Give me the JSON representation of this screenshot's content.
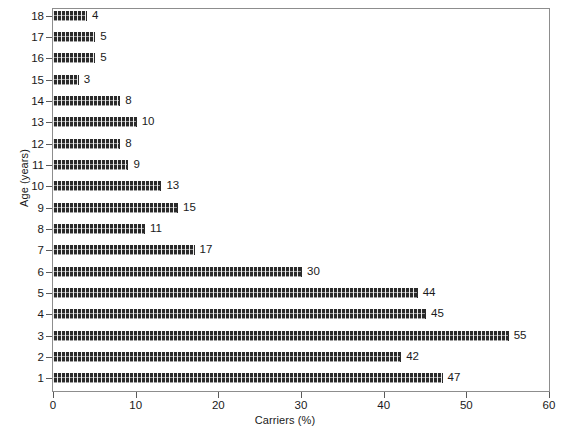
{
  "chart_data": {
    "type": "bar",
    "orientation": "horizontal",
    "title": "",
    "xlabel": "Carriers (%)",
    "ylabel": "Age (years)",
    "xlim": [
      0,
      60
    ],
    "xticks": [
      0,
      10,
      20,
      30,
      40,
      50,
      60
    ],
    "grid": false,
    "legend": null,
    "categories": [
      "1",
      "2",
      "3",
      "4",
      "5",
      "6",
      "7",
      "8",
      "9",
      "10",
      "11",
      "12",
      "13",
      "14",
      "15",
      "16",
      "17",
      "18"
    ],
    "values": [
      47,
      42,
      55,
      45,
      44,
      30,
      17,
      11,
      15,
      13,
      9,
      8,
      10,
      8,
      3,
      5,
      5,
      4
    ],
    "data_labels": [
      "47",
      "42",
      "55",
      "45",
      "44",
      "30",
      "17",
      "11",
      "15",
      "13",
      "9",
      "8",
      "10",
      "8",
      "3",
      "5",
      "5",
      "4"
    ],
    "bar_color": "#2a2a2a",
    "bar_pattern": "crosshatch",
    "frame_color": "#8d8d8d",
    "background": "#ffffff"
  },
  "axes": {
    "x_tick_labels": [
      "0",
      "10",
      "20",
      "30",
      "40",
      "50",
      "60"
    ],
    "y_tick_labels": [
      "18",
      "17",
      "16",
      "15",
      "14",
      "13",
      "12",
      "11",
      "10",
      "9",
      "8",
      "7",
      "6",
      "5",
      "4",
      "3",
      "2",
      "1"
    ],
    "x_axis_title": "Carriers (%)",
    "y_axis_title": "Age (years)"
  }
}
